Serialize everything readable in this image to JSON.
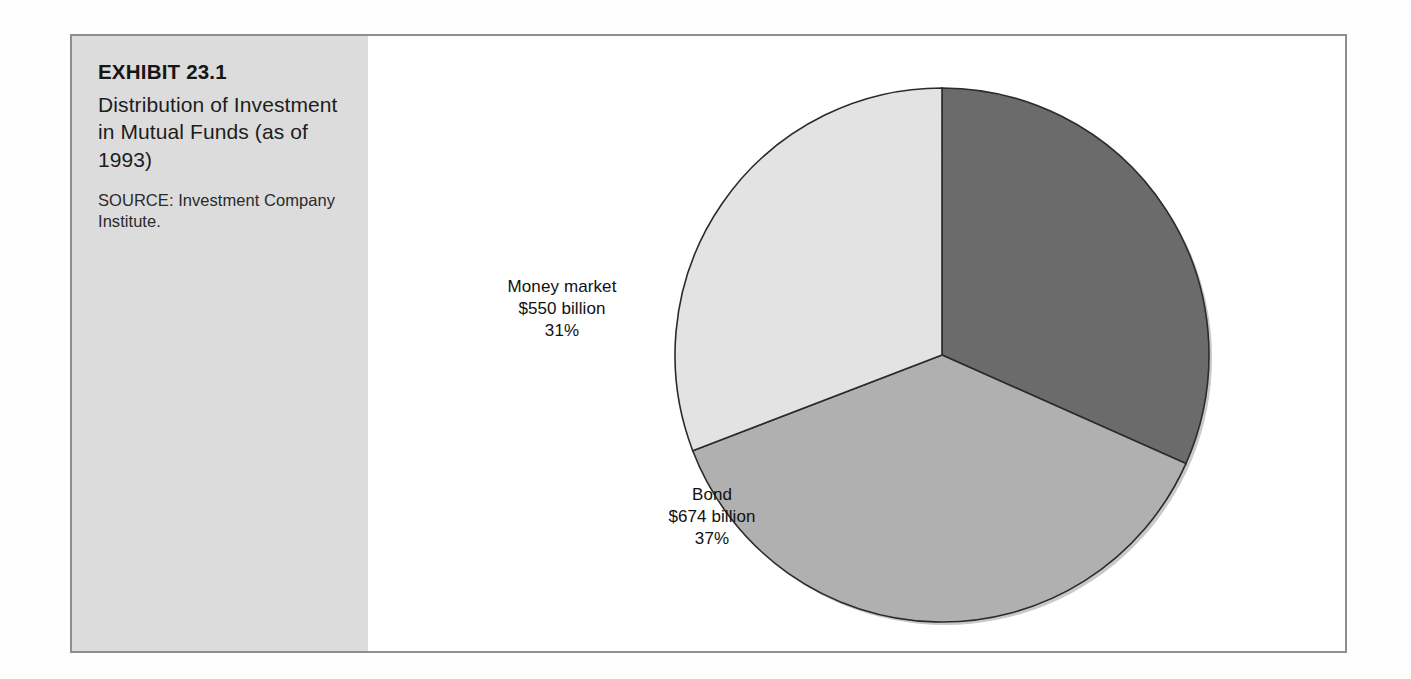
{
  "exhibit": {
    "number": "EXHIBIT 23.1",
    "title": "Distribution of Investment in Mutual Funds (as of 1993)",
    "source": "SOURCE: Investment Company Institute."
  },
  "chart_data": {
    "type": "pie",
    "title": "Distribution of Investment in Mutual Funds (as of 1993)",
    "units": "billions of dollars",
    "legend_position": "none",
    "grid": false,
    "labels_inside": true,
    "categories": [
      "Unlabeled (stock/equity)",
      "Bond",
      "Money market"
    ],
    "values": [
      583,
      674,
      550
    ],
    "percentages": [
      32,
      37,
      31
    ],
    "start_angle_deg": 0,
    "direction": "clockwise",
    "slices": [
      {
        "name": "unlabeled-slice",
        "label": "",
        "amount": "",
        "percent": "",
        "value": 583,
        "percent_value": 32,
        "color": "#6b6b6b",
        "start_deg": 0,
        "end_deg": 114,
        "labeled": false
      },
      {
        "name": "bond-slice",
        "label": "Bond",
        "amount": "$674 billion",
        "percent": "37%",
        "value": 674,
        "percent_value": 37,
        "color": "#b0b0b0",
        "start_deg": 114,
        "end_deg": 249,
        "labeled": true
      },
      {
        "name": "money-market-slice",
        "label": "Money market",
        "amount": "$550 billion",
        "percent": "31%",
        "value": 550,
        "percent_value": 31,
        "color": "#e3e3e3",
        "start_deg": 249,
        "end_deg": 360,
        "labeled": true
      }
    ],
    "geometry": {
      "center_x": 574,
      "center_y": 319,
      "radius": 267
    }
  },
  "style": {
    "panel_background": "#dcdcdc",
    "frame_border": "#8e8e8e",
    "slice_outline": "#2b2b2b",
    "page_background": "#ffffff",
    "text_color": "#161616"
  }
}
